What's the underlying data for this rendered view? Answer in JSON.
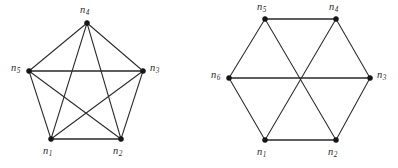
{
  "figure": {
    "background_color": "#ffffff",
    "ink_color": "#2a2a2a",
    "vertex_color": "#151515",
    "width": 398,
    "height": 168
  },
  "panels": [
    {
      "id": "pentagon",
      "name": "complete-graph-k5",
      "vertices": [
        {
          "id": "n1",
          "label": "n",
          "subscript": "1",
          "x": 51,
          "y": 139,
          "label_x": 43,
          "label_y": 146
        },
        {
          "id": "n2",
          "label": "n",
          "subscript": "2",
          "x": 121,
          "y": 139,
          "label_x": 113,
          "label_y": 146
        },
        {
          "id": "n3",
          "label": "n",
          "subscript": "3",
          "x": 143,
          "y": 71,
          "label_x": 150,
          "label_y": 63
        },
        {
          "id": "n4",
          "label": "n",
          "subscript": "4",
          "x": 87,
          "y": 23,
          "label_x": 80,
          "label_y": 5
        },
        {
          "id": "n5",
          "label": "n",
          "subscript": "5",
          "x": 29,
          "y": 71,
          "label_x": 11,
          "label_y": 63
        }
      ],
      "edges": [
        {
          "from": "n1",
          "to": "n2",
          "thick": true
        },
        {
          "from": "n2",
          "to": "n3",
          "thick": false
        },
        {
          "from": "n3",
          "to": "n4",
          "thick": false
        },
        {
          "from": "n4",
          "to": "n5",
          "thick": false
        },
        {
          "from": "n5",
          "to": "n1",
          "thick": false
        },
        {
          "from": "n1",
          "to": "n3",
          "thick": false
        },
        {
          "from": "n1",
          "to": "n4",
          "thick": false
        },
        {
          "from": "n2",
          "to": "n4",
          "thick": false
        },
        {
          "from": "n2",
          "to": "n5",
          "thick": false
        },
        {
          "from": "n3",
          "to": "n5",
          "thick": true
        }
      ]
    },
    {
      "id": "hexagon",
      "name": "hexagon-with-main-diagonals",
      "vertices": [
        {
          "id": "n1",
          "label": "n",
          "subscript": "1",
          "x": 66,
          "y": 140,
          "label_x": 58,
          "label_y": 147
        },
        {
          "id": "n2",
          "label": "n",
          "subscript": "2",
          "x": 137,
          "y": 140,
          "label_x": 129,
          "label_y": 147
        },
        {
          "id": "n3",
          "label": "n",
          "subscript": "3",
          "x": 171,
          "y": 78,
          "label_x": 178,
          "label_y": 70
        },
        {
          "id": "n4",
          "label": "n",
          "subscript": "4",
          "x": 137,
          "y": 19,
          "label_x": 130,
          "label_y": 2
        },
        {
          "id": "n5",
          "label": "n",
          "subscript": "5",
          "x": 66,
          "y": 19,
          "label_x": 58,
          "label_y": 2
        },
        {
          "id": "n6",
          "label": "n",
          "subscript": "6",
          "x": 30,
          "y": 78,
          "label_x": 12,
          "label_y": 70
        }
      ],
      "edges": [
        {
          "from": "n1",
          "to": "n2",
          "thick": true
        },
        {
          "from": "n2",
          "to": "n3",
          "thick": false
        },
        {
          "from": "n3",
          "to": "n4",
          "thick": false
        },
        {
          "from": "n4",
          "to": "n5",
          "thick": true
        },
        {
          "from": "n5",
          "to": "n6",
          "thick": false
        },
        {
          "from": "n6",
          "to": "n1",
          "thick": false
        },
        {
          "from": "n1",
          "to": "n4",
          "thick": false
        },
        {
          "from": "n2",
          "to": "n5",
          "thick": false
        },
        {
          "from": "n3",
          "to": "n6",
          "thick": true
        }
      ]
    }
  ]
}
